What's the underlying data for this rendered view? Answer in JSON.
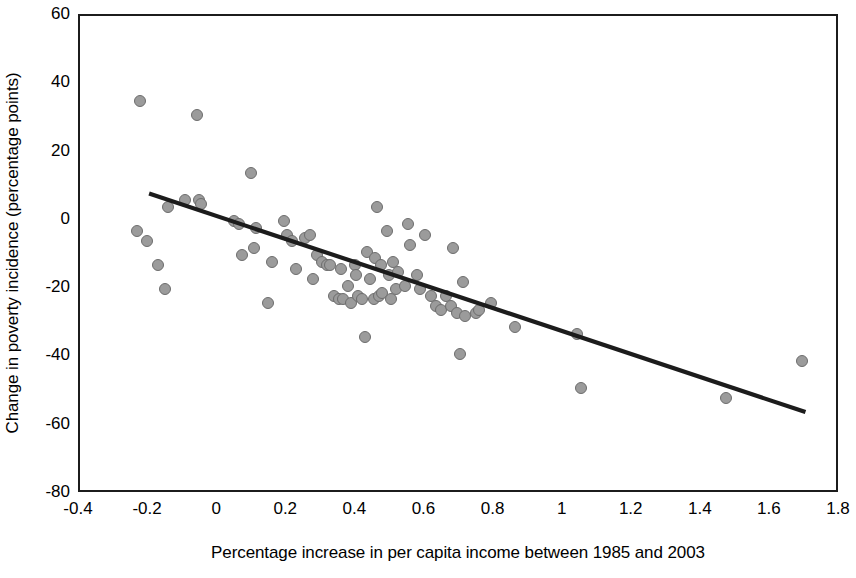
{
  "chart_data": {
    "type": "scatter",
    "title": "",
    "xlabel": "Percentage increase in per capita income between 1985 and 2003",
    "ylabel": "Change in poverty incidence (percentage points)",
    "xlim": [
      -0.4,
      1.8
    ],
    "ylim": [
      -80,
      60
    ],
    "xticks": [
      -0.4,
      -0.2,
      0,
      0.2,
      0.4,
      0.6,
      0.8,
      1,
      1.2,
      1.4,
      1.6,
      1.8
    ],
    "xtick_labels": [
      "-0.4",
      "-0.2",
      "0",
      "0.2",
      "0.4",
      "0.6",
      "0.8",
      "1",
      "1.2",
      "1.4",
      "1.6",
      "1.8"
    ],
    "yticks": [
      60,
      40,
      20,
      0,
      -20,
      -40,
      -60,
      -80
    ],
    "ytick_labels": [
      "60",
      "40",
      "20",
      "0",
      "-20",
      "-40",
      "-60",
      "-80"
    ],
    "grid": false,
    "legend": null,
    "marker_color": "#9b9b9b",
    "marker_edge_color": "#6d6d6d",
    "trend_line_color": "#1c1c1c",
    "trendline": {
      "type": "linear",
      "x_start": -0.2,
      "y_start": 8,
      "x_end": 1.7,
      "y_end": -56
    },
    "points": [
      [
        -0.235,
        -3
      ],
      [
        -0.225,
        35
      ],
      [
        -0.205,
        -6
      ],
      [
        -0.175,
        -13
      ],
      [
        -0.155,
        -20
      ],
      [
        -0.145,
        4
      ],
      [
        -0.095,
        6
      ],
      [
        -0.06,
        31
      ],
      [
        -0.055,
        6
      ],
      [
        -0.05,
        5
      ],
      [
        0.045,
        0
      ],
      [
        0.06,
        -1
      ],
      [
        0.07,
        -10
      ],
      [
        0.095,
        14
      ],
      [
        0.105,
        -8
      ],
      [
        0.11,
        -2
      ],
      [
        0.145,
        -24
      ],
      [
        0.155,
        -12
      ],
      [
        0.19,
        0
      ],
      [
        0.2,
        -4
      ],
      [
        0.215,
        -6
      ],
      [
        0.225,
        -14
      ],
      [
        0.25,
        -5
      ],
      [
        0.265,
        -4
      ],
      [
        0.275,
        -17
      ],
      [
        0.285,
        -10
      ],
      [
        0.3,
        -12
      ],
      [
        0.315,
        -13
      ],
      [
        0.325,
        -13
      ],
      [
        0.335,
        -22
      ],
      [
        0.35,
        -23
      ],
      [
        0.355,
        -14
      ],
      [
        0.36,
        -23
      ],
      [
        0.375,
        -19
      ],
      [
        0.385,
        -24
      ],
      [
        0.395,
        -13
      ],
      [
        0.4,
        -16
      ],
      [
        0.405,
        -22
      ],
      [
        0.415,
        -23
      ],
      [
        0.425,
        -34
      ],
      [
        0.43,
        -9
      ],
      [
        0.44,
        -17
      ],
      [
        0.45,
        -23
      ],
      [
        0.455,
        -11
      ],
      [
        0.46,
        4
      ],
      [
        0.465,
        -22
      ],
      [
        0.47,
        -13
      ],
      [
        0.475,
        -21
      ],
      [
        0.49,
        -3
      ],
      [
        0.495,
        -16
      ],
      [
        0.5,
        -23
      ],
      [
        0.505,
        -12
      ],
      [
        0.515,
        -20
      ],
      [
        0.52,
        -15
      ],
      [
        0.54,
        -19
      ],
      [
        0.55,
        -1
      ],
      [
        0.555,
        -7
      ],
      [
        0.575,
        -16
      ],
      [
        0.585,
        -20
      ],
      [
        0.6,
        -4
      ],
      [
        0.615,
        -22
      ],
      [
        0.63,
        -25
      ],
      [
        0.645,
        -26
      ],
      [
        0.66,
        -22
      ],
      [
        0.675,
        -25
      ],
      [
        0.68,
        -8
      ],
      [
        0.69,
        -27
      ],
      [
        0.7,
        -39
      ],
      [
        0.71,
        -18
      ],
      [
        0.715,
        -28
      ],
      [
        0.745,
        -27
      ],
      [
        0.755,
        -26
      ],
      [
        0.79,
        -24
      ],
      [
        0.86,
        -31
      ],
      [
        1.04,
        -33
      ],
      [
        1.05,
        -49
      ],
      [
        1.47,
        -52
      ],
      [
        1.69,
        -41
      ]
    ]
  }
}
